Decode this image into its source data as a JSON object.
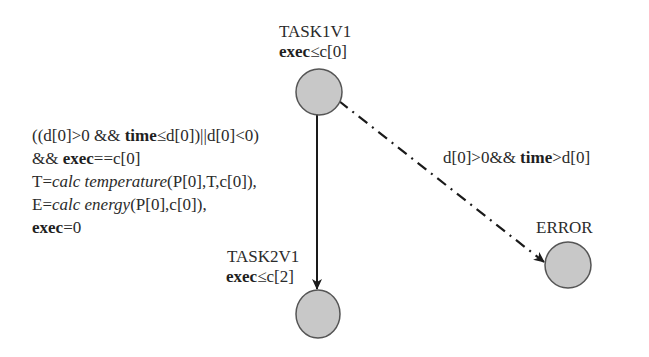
{
  "diagram": {
    "type": "timed-automaton",
    "colors": {
      "node_fill": "#c8c8c8",
      "node_stroke": "#555555",
      "edge": "#1a1a1a",
      "text": "#2b2b2b"
    },
    "states": [
      {
        "id": "task1v1",
        "name": "TASK1V1",
        "invariant": {
          "var": "exec",
          "op": "≤",
          "rhs": "c[0]"
        }
      },
      {
        "id": "task2v1",
        "name": "TASK2V1",
        "invariant": {
          "var": "exec",
          "op": "≤",
          "rhs": "c[2]"
        }
      },
      {
        "id": "error",
        "name": "ERROR"
      }
    ],
    "transitions": [
      {
        "from": "TASK1V1",
        "to": "TASK2V1",
        "style": "solid",
        "guard_lines": [
          {
            "pre": "((d[0]>0 && ",
            "bold": "time",
            "post": "≤d[0])||d[0]<0)"
          },
          {
            "pre": "&& ",
            "bold": "exec",
            "post": "==c[0]"
          }
        ],
        "update_lines": [
          {
            "pre": "T=",
            "italic": "calc temperature",
            "post": "(P[0],T,c[0]),"
          },
          {
            "pre": "E=",
            "italic": "calc energy",
            "post": "(P[0],c[0]),"
          },
          {
            "bold": "exec",
            "post": "=0"
          }
        ]
      },
      {
        "from": "TASK1V1",
        "to": "ERROR",
        "style": "dash-dot",
        "guard": {
          "pre": "d[0]>0&& ",
          "bold": "time",
          "post": ">d[0]"
        }
      }
    ]
  }
}
